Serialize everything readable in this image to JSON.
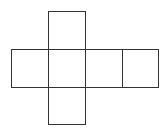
{
  "diagram": {
    "type": "cube-net",
    "stroke_color": "#333333",
    "background": "#ffffff",
    "squares": [
      {
        "id": "top",
        "row": 0,
        "col": 1
      },
      {
        "id": "left",
        "row": 1,
        "col": 0
      },
      {
        "id": "center",
        "row": 1,
        "col": 1
      },
      {
        "id": "right-1",
        "row": 1,
        "col": 2
      },
      {
        "id": "right-2",
        "row": 1,
        "col": 3
      },
      {
        "id": "bottom",
        "row": 2,
        "col": 1
      }
    ]
  }
}
